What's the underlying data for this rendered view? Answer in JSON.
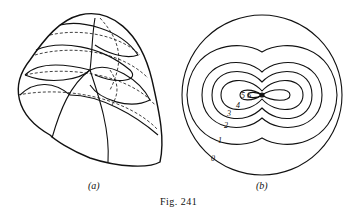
{
  "figure": {
    "caption": "Fig. 241",
    "panels": [
      {
        "label": "(a)",
        "description": "3D egg-shaped surface with solid and dashed curved grid lines"
      },
      {
        "label": "(b)",
        "description": "Circle with nested contour lines forming dumbbell/figure-eight shapes around a central singular point"
      }
    ],
    "contour_labels": [
      "0",
      "1",
      "2",
      "3",
      "4",
      "5",
      "6"
    ]
  }
}
